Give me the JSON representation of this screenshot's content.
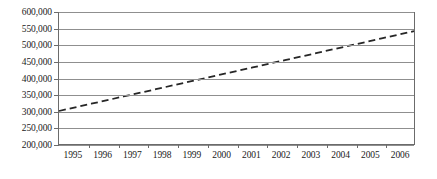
{
  "chart_data": {
    "type": "line",
    "title": "",
    "subtitle": "",
    "xlabel": "",
    "ylabel": "",
    "categories": [
      "1995",
      "1996",
      "1997",
      "1998",
      "1999",
      "2000",
      "2001",
      "2002",
      "2003",
      "2004",
      "2005",
      "2006"
    ],
    "series": [
      {
        "name": "trend",
        "style": "dashed",
        "color": "#262626",
        "values": [
          300000,
          322000,
          344000,
          366000,
          388000,
          410000,
          432000,
          454000,
          476000,
          498000,
          520000,
          542000
        ]
      }
    ],
    "ylim": [
      200000,
      600000
    ],
    "ytick_step": 50000,
    "ytick_labels": [
      "600,000",
      "550,000",
      "500,000",
      "450,000",
      "400,000",
      "350,000",
      "300,000",
      "250,000",
      "200,000"
    ],
    "ytick_values": [
      600000,
      550000,
      500000,
      450000,
      400000,
      350000,
      300000,
      250000,
      200000
    ],
    "grid": {
      "horizontal": true,
      "vertical": false,
      "color": "#8f8f8f"
    },
    "legend": {
      "visible": false,
      "position": "none",
      "entries": []
    },
    "axis": {
      "left_border": true,
      "right_border": true,
      "bottom_border": true,
      "top_border": false,
      "border_color": "#6b6b6b",
      "tick_marks": true
    },
    "background": "#ffffff",
    "annotations": []
  }
}
